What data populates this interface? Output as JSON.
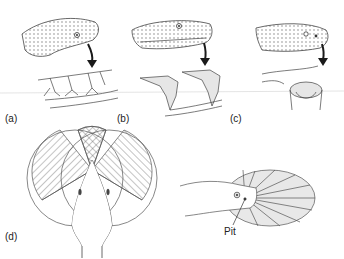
{
  "figure": {
    "panels": [
      {
        "id": "a",
        "label": "(a)",
        "description": "snake head with arrow pointing to fine sensory nerve endings"
      },
      {
        "id": "b",
        "label": "(b)",
        "description": "snake head with arrow pointing to labial pit receptors"
      },
      {
        "id": "c",
        "label": "(c)",
        "description": "snake head with arrow pointing to loreal pit organ cross-section"
      },
      {
        "id": "d",
        "label": "(d)",
        "description": "top view of snake head with overlapping hatched visual/thermal fields"
      }
    ],
    "pit_label": "Pit",
    "colors": {
      "ink": "#333333",
      "shade": "#d9d9d9",
      "arrow": "#1a1a1a"
    }
  }
}
